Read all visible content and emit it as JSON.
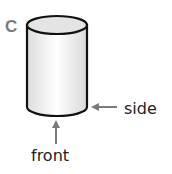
{
  "figure": {
    "label": "C",
    "shape": "cylinder",
    "annotations": {
      "side": "side",
      "front": "front"
    },
    "colors": {
      "outline": "#111111",
      "arrow": "#7a7a7a",
      "label": "#7a7a7a"
    }
  }
}
